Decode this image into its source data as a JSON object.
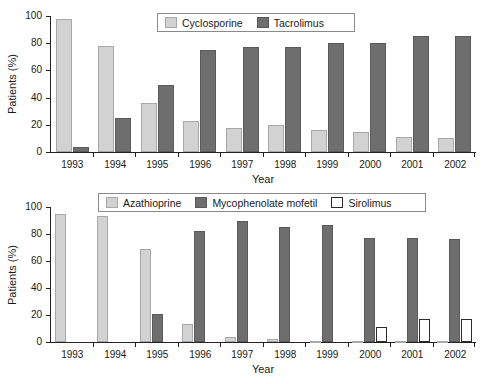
{
  "chart_data": [
    {
      "id": "top",
      "type": "bar",
      "title": "",
      "xlabel": "Year",
      "ylabel": "Patients (%)",
      "ylim": [
        0,
        100
      ],
      "yticks": [
        0,
        20,
        40,
        60,
        80,
        100
      ],
      "grid": false,
      "legend_position": "top-center",
      "categories": [
        "1993",
        "1994",
        "1995",
        "1996",
        "1997",
        "1998",
        "1999",
        "2000",
        "2001",
        "2002"
      ],
      "series": [
        {
          "name": "Cyclosporine",
          "color": "#d2d2d2",
          "values": [
            98,
            78,
            36,
            23,
            18,
            20,
            16,
            15,
            11,
            10
          ]
        },
        {
          "name": "Tacrolimus",
          "color": "#6e6e6e",
          "values": [
            4,
            25,
            49,
            75,
            77,
            77,
            80,
            80,
            85,
            85
          ]
        }
      ]
    },
    {
      "id": "bottom",
      "type": "bar",
      "title": "",
      "xlabel": "Year",
      "ylabel": "Patients (%)",
      "ylim": [
        0,
        100
      ],
      "yticks": [
        0,
        20,
        40,
        60,
        80,
        100
      ],
      "grid": false,
      "legend_position": "top-center",
      "categories": [
        "1993",
        "1994",
        "1995",
        "1996",
        "1997",
        "1998",
        "1999",
        "2000",
        "2001",
        "2002"
      ],
      "series": [
        {
          "name": "Azathioprine",
          "color": "#d2d2d2",
          "values": [
            95,
            93,
            69,
            13,
            4,
            2.5,
            1,
            0.7,
            0.5,
            0.5
          ]
        },
        {
          "name": "Mycophenolate mofetil",
          "color": "#6e6e6e",
          "values": [
            0,
            0,
            21,
            82,
            90,
            85,
            87,
            77,
            77,
            76
          ]
        },
        {
          "name": "Sirolimus",
          "color": "#ffffff",
          "values": [
            0,
            0,
            0,
            0,
            0,
            0,
            0,
            11,
            17,
            17
          ]
        }
      ]
    }
  ]
}
